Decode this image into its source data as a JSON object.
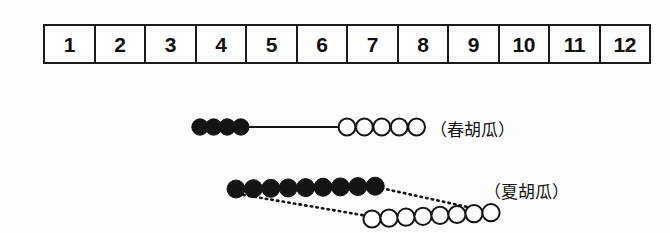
{
  "figure": {
    "background_color": "#fdfdfd",
    "ink_color": "#141414"
  },
  "month_scale": {
    "name": "month-scale-bar",
    "cells": [
      {
        "label": "1"
      },
      {
        "label": "2"
      },
      {
        "label": "3"
      },
      {
        "label": "4"
      },
      {
        "label": "5"
      },
      {
        "label": "6"
      },
      {
        "label": "7"
      },
      {
        "label": "8"
      },
      {
        "label": "9"
      },
      {
        "label": "10"
      },
      {
        "label": "11"
      },
      {
        "label": "12"
      }
    ]
  },
  "crops": [
    {
      "id": "spring",
      "label": "（春胡瓜）",
      "filled_count": 4,
      "open_count": 5,
      "connector": "solid"
    },
    {
      "id": "summer",
      "label": "（夏胡瓜）",
      "filled_count": 9,
      "open_count": 8,
      "connector": "dotted"
    }
  ],
  "chart_data": {
    "type": "timeline",
    "title": "",
    "xlabel": "",
    "ylabel": "",
    "x_axis": {
      "tick_labels": [
        "1",
        "2",
        "3",
        "4",
        "5",
        "6",
        "7",
        "8",
        "9",
        "10",
        "11",
        "12"
      ],
      "range": [
        1,
        12
      ],
      "grid": true
    },
    "legend": {
      "filled_marker": "●",
      "open_marker": "○"
    },
    "series": [
      {
        "name": "（春胡瓜）",
        "filled_markers": 4,
        "open_markers": 5,
        "filled_span_months": [
          3.0,
          4.7
        ],
        "open_span_months": [
          5.8,
          7.4
        ],
        "connector_style": "solid"
      },
      {
        "name": "（夏胡瓜）",
        "filled_markers": 9,
        "open_markers": 8,
        "filled_span_months": [
          4.7,
          7.6
        ],
        "open_span_months": [
          7.4,
          9.8
        ],
        "connector_style": "dotted"
      }
    ]
  }
}
